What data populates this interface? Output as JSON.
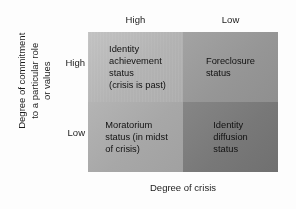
{
  "chart_data": {
    "type": "table",
    "title": "",
    "xlabel": "Degree of crisis",
    "ylabel": "Degree of commitment\nto a particular role\nor values",
    "columns": [
      "High",
      "Low"
    ],
    "rows": [
      "High",
      "Low"
    ],
    "grid": false,
    "legend": "none",
    "cells": [
      {
        "row": "High",
        "column": "High",
        "label": "Identity\nachievement\nstatus\n(crisis is past)",
        "color": "#b4b4b4"
      },
      {
        "row": "High",
        "column": "Low",
        "label": "Foreclosure\nstatus",
        "color": "#969696"
      },
      {
        "row": "Low",
        "column": "High",
        "label": "Moratorium\nstatus (in midst\nof crisis)",
        "color": "#a7a7a7"
      },
      {
        "row": "Low",
        "column": "Low",
        "label": "Identity\ndiffusion\nstatus",
        "color": "#787878"
      }
    ]
  },
  "axes": {
    "x_title": "Degree of crisis",
    "y_title": "Degree of commitment\nto a particular role\nor values",
    "column_headers": [
      "High",
      "Low"
    ],
    "row_headers": [
      "High",
      "Low"
    ]
  },
  "quadrants": [
    {
      "text": "Identity\nachievement\nstatus\n(crisis is past)"
    },
    {
      "text": "Foreclosure\nstatus"
    },
    {
      "text": "Moratorium\nstatus (in midst\nof crisis)"
    },
    {
      "text": "Identity\ndiffusion\nstatus"
    }
  ]
}
